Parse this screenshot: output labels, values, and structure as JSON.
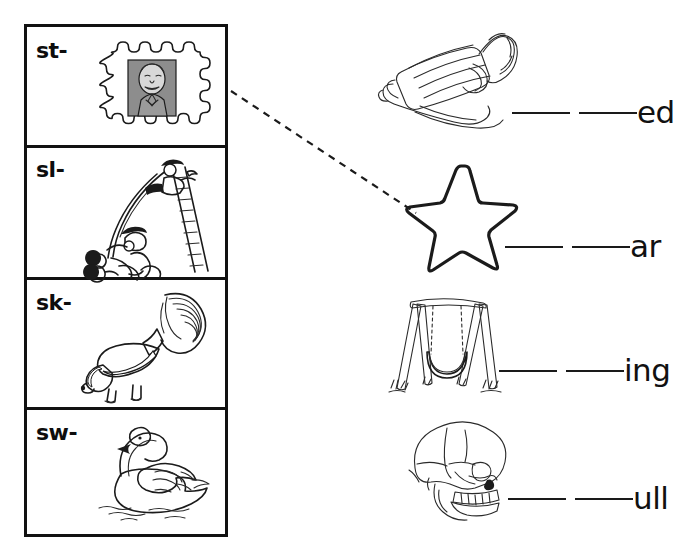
{
  "worksheet": {
    "title": "S-blends picture matching worksheet",
    "ink_color": "#1b1b1b",
    "background_color": "#ffffff"
  },
  "blend_box": {
    "name": "blend-choices-box",
    "rows": [
      {
        "label": "st-",
        "picture": "postage-stamp-icon",
        "picture_name": "stamp"
      },
      {
        "label": "sl-",
        "picture": "playground-slide-icon",
        "picture_name": "slide"
      },
      {
        "label": "sk-",
        "picture": "skunk-icon",
        "picture_name": "skunk"
      },
      {
        "label": "sw-",
        "picture": "swan-icon",
        "picture_name": "swan"
      }
    ]
  },
  "answers": [
    {
      "picture": "sled-icon",
      "picture_name": "sled",
      "blank_count": 2,
      "ending": "ed"
    },
    {
      "picture": "star-icon",
      "picture_name": "star",
      "blank_count": 2,
      "ending": "ar"
    },
    {
      "picture": "swing-icon",
      "picture_name": "swing",
      "blank_count": 2,
      "ending": "ing"
    },
    {
      "picture": "skull-icon",
      "picture_name": "skull",
      "blank_count": 2,
      "ending": "ull"
    }
  ],
  "connector": {
    "name": "drawn-match-line",
    "style": "dashed",
    "from": "blend-row-st",
    "to": "answer-row-star"
  }
}
